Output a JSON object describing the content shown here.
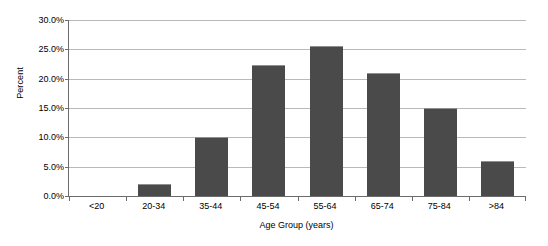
{
  "chart_data": {
    "type": "bar",
    "title": "",
    "xlabel": "Age Group (years)",
    "ylabel": "Percent",
    "categories": [
      "<20",
      "20-34",
      "35-44",
      "45-54",
      "55-64",
      "65-74",
      "75-84",
      ">84"
    ],
    "values": [
      0.0,
      2.0,
      10.0,
      22.4,
      25.5,
      21.0,
      15.0,
      6.0
    ],
    "ylim": [
      0.0,
      30.0
    ],
    "ytick_values": [
      0.0,
      5.0,
      10.0,
      15.0,
      20.0,
      25.0,
      30.0
    ],
    "ytick_labels": [
      "0.0%",
      "5.0%",
      "10.0%",
      "15.0%",
      "20.0%",
      "25.0%",
      "30.0%"
    ],
    "grid": true,
    "legend": "none",
    "bar_color": "#4a4a4a",
    "gridline_color": "#b9b9b9",
    "axis_color": "#6b6b6b",
    "background_color": "#ffffff"
  }
}
